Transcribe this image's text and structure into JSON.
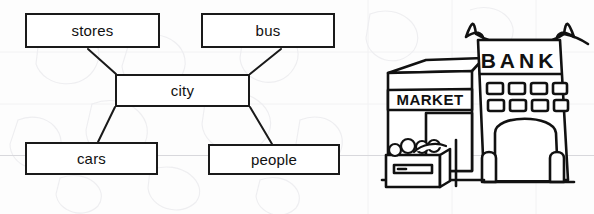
{
  "page": {
    "background_color": "#fdfdfd",
    "ink_color": "#1a1a1a",
    "ruled_line_color": "#d8d8dc"
  },
  "concept_map": {
    "type": "bubble-map",
    "center_label": "city",
    "nodes": [
      {
        "id": "stores",
        "label": "stores",
        "position": "top-left"
      },
      {
        "id": "bus",
        "label": "bus",
        "position": "top-right"
      },
      {
        "id": "city",
        "label": "city",
        "position": "center"
      },
      {
        "id": "cars",
        "label": "cars",
        "position": "bottom-left"
      },
      {
        "id": "people",
        "label": "people",
        "position": "bottom-right"
      }
    ],
    "connections": [
      {
        "from": "stores",
        "to": "city"
      },
      {
        "from": "bus",
        "to": "city"
      },
      {
        "from": "city",
        "to": "cars"
      },
      {
        "from": "city",
        "to": "people"
      }
    ]
  },
  "illustration": {
    "caption": "line drawing of a city street with a market and a bank",
    "signs": [
      {
        "id": "market-sign",
        "text": "MARKET"
      },
      {
        "id": "bank-sign",
        "text": "BANK"
      }
    ],
    "elements": [
      "market-building",
      "bank-building",
      "pagoda-roof",
      "arched-doorway",
      "market-doorway",
      "produce-crate",
      "bollards"
    ]
  }
}
